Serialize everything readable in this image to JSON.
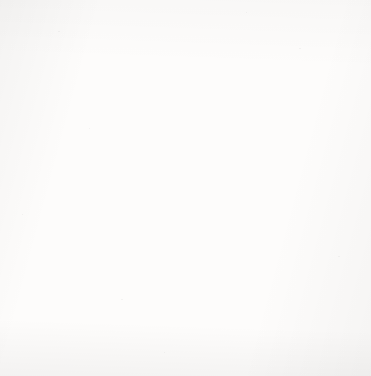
{
  "figure": {
    "kind": "coordinate-plane",
    "background_color": "#fdfcfb",
    "grid_color": "#b8b8b8",
    "axis_color": "#1a1a1a"
  },
  "axes": {
    "x_name": "x",
    "y_name": "y",
    "x_tick_labels": [
      "−10",
      "−9",
      "−8",
      "−7",
      "−6",
      "−5",
      "−4",
      "−3",
      "−2",
      "−1",
      "0",
      "1",
      "2",
      "3",
      "4",
      "5",
      "6",
      "7",
      "8",
      "9",
      "10"
    ],
    "y_tick_labels": [
      "10",
      "9",
      "8",
      "7",
      "6",
      "5",
      "4",
      "3",
      "2",
      "1",
      "−1",
      "−2",
      "−3",
      "−4",
      "−5",
      "−6",
      "−7",
      "−8",
      "−9",
      "−10"
    ],
    "x_min": -10,
    "x_max": 10,
    "y_min": -10,
    "y_max": 10,
    "origin_annotation": "Origin"
  },
  "chart_data": {
    "type": "scatter",
    "title": "",
    "xlabel": "x",
    "ylabel": "y",
    "xlim": [
      -10,
      10
    ],
    "ylim": [
      -10,
      10
    ],
    "grid": true,
    "legend": "none",
    "annotations": [
      "Origin"
    ],
    "points": [
      {
        "label": "A",
        "x": -8,
        "y": 0,
        "label_pos": "up-left"
      },
      {
        "label": "B",
        "x": -5,
        "y": 8,
        "label_pos": "down-right"
      },
      {
        "label": "C",
        "x": -3,
        "y": 3,
        "label_pos": "down-right"
      },
      {
        "label": "D",
        "x": 0,
        "y": 4,
        "label_pos": "down-right"
      },
      {
        "label": "E",
        "x": 8,
        "y": 6,
        "label_pos": "down-right"
      },
      {
        "label": "F",
        "x": -4,
        "y": -3,
        "label_pos": "down-right"
      },
      {
        "label": "G",
        "x": 0,
        "y": -5,
        "label_pos": "down-right"
      },
      {
        "label": "H",
        "x": 0.55,
        "y": -0.45,
        "label_pos": "inline",
        "no_dot": true
      },
      {
        "label": "I",
        "x": 5,
        "y": -3,
        "label_pos": "down-right"
      },
      {
        "label": "J",
        "x": 7,
        "y": 0,
        "label_pos": "up-right"
      }
    ]
  }
}
